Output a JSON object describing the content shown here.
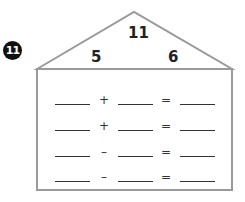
{
  "problem": {
    "number": "11",
    "roof": {
      "top": "11",
      "left": "5",
      "right": "6"
    },
    "equations": [
      {
        "operator": "+",
        "equals": "="
      },
      {
        "operator": "+",
        "equals": "="
      },
      {
        "operator": "–",
        "equals": "="
      },
      {
        "operator": "–",
        "equals": "="
      }
    ]
  },
  "colors": {
    "outline": "#9a9a9a",
    "badge": "#111111",
    "text": "#222222"
  }
}
